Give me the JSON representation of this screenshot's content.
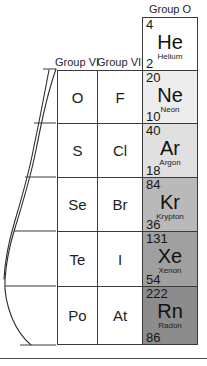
{
  "figure": {
    "kind": "periodic-table-excerpt"
  },
  "headers": {
    "group_o": "Group O",
    "group_vi": "Group VI",
    "group_vii": "Group VII"
  },
  "columns": [
    {
      "id": "group-vi",
      "label": "Group VI"
    },
    {
      "id": "group-vii",
      "label": "Group VII"
    },
    {
      "id": "group-o",
      "label": "Group O"
    }
  ],
  "colors": {
    "cell_border": "#3a3a3a",
    "plain_cell_background": "#ffffff",
    "helium_background": "#ffffff",
    "neon_background": "#ededed",
    "argon_background": "#e0e0e0",
    "krypton_background": "#b9b9b9",
    "xenon_background": "#a0a0a0",
    "radon_background": "#8c8c8c",
    "text": "#161616",
    "rule": "#4a4a4a"
  },
  "cells": {
    "helium": {
      "mass": "4",
      "symbol": "He",
      "name": "Helium",
      "number": "2"
    },
    "neon": {
      "mass": "20",
      "symbol": "Ne",
      "name": "Neon",
      "number": "10"
    },
    "argon": {
      "mass": "40",
      "symbol": "Ar",
      "name": "Argon",
      "number": "18"
    },
    "krypton": {
      "mass": "84",
      "symbol": "Kr",
      "name": "Krypton",
      "number": "36"
    },
    "xenon": {
      "mass": "131",
      "symbol": "Xe",
      "name": "Xenon",
      "number": "54"
    },
    "radon": {
      "mass": "222",
      "symbol": "Rn",
      "name": "Radon",
      "number": "86"
    },
    "oxygen": {
      "symbol": "O"
    },
    "fluorine": {
      "symbol": "F"
    },
    "sulfur": {
      "symbol": "S"
    },
    "chlorine": {
      "symbol": "Cl"
    },
    "selenium": {
      "symbol": "Se"
    },
    "bromine": {
      "symbol": "Br"
    },
    "tellurium": {
      "symbol": "Te"
    },
    "iodine": {
      "symbol": "I"
    },
    "polonium": {
      "symbol": "Po"
    },
    "astatine": {
      "symbol": "At"
    }
  }
}
